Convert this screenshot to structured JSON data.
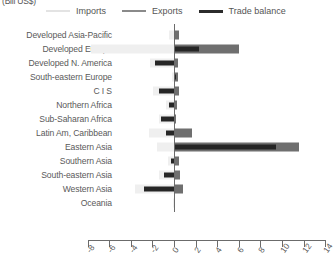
{
  "units_label": "(Bill US$)",
  "legend": {
    "items": [
      {
        "name": "imports",
        "label": "Imports",
        "color": "#efefef"
      },
      {
        "name": "exports",
        "label": "Exports",
        "color": "#6f6f6f"
      },
      {
        "name": "balance",
        "label": "Trade balance",
        "color": "#262626"
      }
    ]
  },
  "chart_data": {
    "type": "bar",
    "orientation": "horizontal",
    "title": "",
    "subtitle": "",
    "xlabel": "(Bill US$)",
    "ylabel": "",
    "xlim": [
      -8,
      14
    ],
    "xticks": [
      -8,
      -6,
      -4,
      -2,
      0,
      2,
      4,
      6,
      8,
      10,
      12,
      14
    ],
    "xtick_labels": [
      "-8",
      "-6",
      "-4",
      "-2",
      "0",
      "2",
      "4",
      "6",
      "8",
      "10",
      "12",
      "14"
    ],
    "grid": false,
    "legend_position": "top",
    "categories": [
      "Developed Asia-Pacific",
      "Developed Europe",
      "Developed N. America",
      "South-eastern Europe",
      "C I S",
      "Northern Africa",
      "Sub-Saharan Africa",
      "Latin Am, Caribbean",
      "Eastern Asia",
      "Southern Asia",
      "South-eastern Asia",
      "Western Asia",
      "Oceania"
    ],
    "series": [
      {
        "name": "Imports",
        "color": "#efefef",
        "values": [
          -0.5,
          -7.7,
          -2.2,
          -0.2,
          -1.9,
          -0.7,
          -1.4,
          -2.3,
          -1.6,
          -0.6,
          -1.4,
          -3.6,
          -0.05
        ]
      },
      {
        "name": "Exports",
        "color": "#6f6f6f",
        "values": [
          0.45,
          6.0,
          0.35,
          0.35,
          0.5,
          0.25,
          0.2,
          1.7,
          11.6,
          0.45,
          0.55,
          0.8,
          0.05
        ]
      },
      {
        "name": "Trade balance",
        "color": "#262626",
        "values": [
          0.1,
          2.3,
          -1.8,
          0.15,
          -1.4,
          -0.5,
          -1.2,
          -0.7,
          9.4,
          -0.3,
          -0.9,
          -2.8,
          0.02
        ]
      }
    ]
  }
}
